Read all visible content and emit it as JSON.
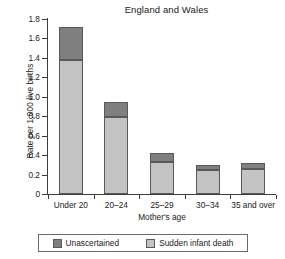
{
  "chart_data": {
    "type": "bar",
    "title": "England and Wales",
    "xlabel": "Mother's age",
    "ylabel": "Rate per 1,000 live births",
    "categories": [
      "Under 20",
      "20–24",
      "25–29",
      "30–34",
      "35 and over"
    ],
    "series": [
      {
        "name": "Sudden infant death",
        "color": "#c3c3c3",
        "values": [
          1.38,
          0.79,
          0.33,
          0.25,
          0.26
        ]
      },
      {
        "name": "Unascertained",
        "color": "#7f7f7f",
        "values": [
          0.34,
          0.16,
          0.09,
          0.05,
          0.06
        ]
      }
    ],
    "totals": [
      1.72,
      0.95,
      0.42,
      0.3,
      0.32
    ],
    "stacked": true,
    "ylim": [
      0,
      1.8
    ],
    "yticks": [
      0,
      0.2,
      0.4,
      0.6,
      0.8,
      1.0,
      1.2,
      1.4,
      1.6,
      1.8
    ],
    "ytick_labels": [
      "0",
      "0.2",
      "0.4",
      "0.6",
      "0.8",
      "1.0",
      "1.2",
      "1.4",
      "1.6",
      "1.8"
    ],
    "grid": false,
    "legend_position": "bottom",
    "legend_order": [
      "Unascertained",
      "Sudden infant death"
    ]
  },
  "colors": {
    "unascertained": "#7f7f7f",
    "sudden_infant_death": "#c3c3c3",
    "axis": "#3d3d3d",
    "bar_edge": "#595959",
    "text": "#1a1a1a",
    "background": "#ffffff"
  }
}
